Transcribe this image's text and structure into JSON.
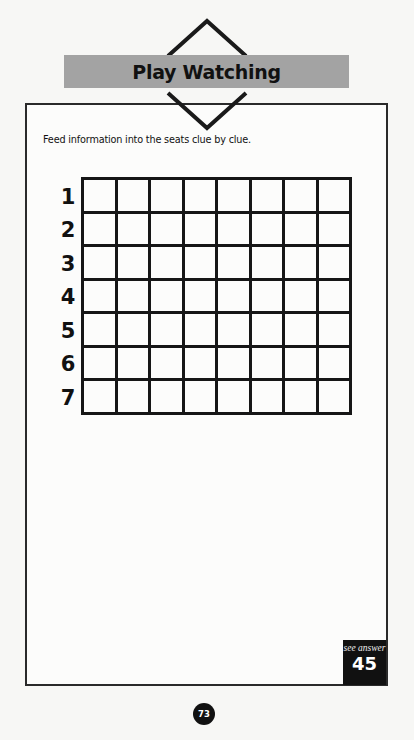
{
  "header": {
    "title": "Play Watching"
  },
  "puzzle": {
    "instruction": "Feed information into the seats clue by clue.",
    "rows": [
      "1",
      "2",
      "3",
      "4",
      "5",
      "6",
      "7"
    ],
    "columns_count": 8
  },
  "answer_ref": {
    "label": "see answer",
    "number": "45"
  },
  "page": {
    "number": "73"
  },
  "colors": {
    "banner": "#a3a3a3",
    "ink": "#111111",
    "paper": "#fcfcfb"
  }
}
